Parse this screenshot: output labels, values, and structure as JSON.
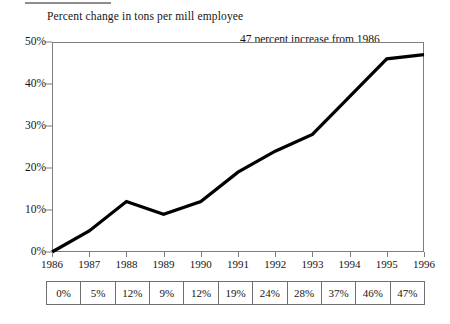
{
  "chart_data": {
    "type": "line",
    "title": "Percent change in tons per mill employee",
    "xlabel": "",
    "ylabel": "",
    "categories": [
      "1986",
      "1987",
      "1988",
      "1989",
      "1990",
      "1991",
      "1992",
      "1993",
      "1994",
      "1995",
      "1996"
    ],
    "values": [
      0,
      5,
      12,
      9,
      12,
      19,
      24,
      28,
      37,
      46,
      47
    ],
    "value_labels": [
      "0%",
      "5%",
      "12%",
      "9%",
      "12%",
      "19%",
      "24%",
      "28%",
      "37%",
      "46%",
      "47%"
    ],
    "ylim": [
      0,
      50
    ],
    "y_ticks": [
      0,
      10,
      20,
      30,
      40,
      50
    ],
    "y_tick_labels": [
      "0%",
      "10%",
      "20%",
      "30%",
      "40%",
      "50%"
    ],
    "grid": false,
    "legend": "none",
    "line_color": "#000000",
    "annotations": [
      {
        "id": "increase",
        "text": "47 percent increase from 1986"
      },
      {
        "id": "cagr_line1",
        "text": "Compounded annual"
      },
      {
        "id": "cagr_line2",
        "text": "growth rate: 3.9 percent"
      }
    ]
  },
  "table": {
    "row_values": [
      "0%",
      "5%",
      "12%",
      "9%",
      "12%",
      "19%",
      "24%",
      "28%",
      "37%",
      "46%",
      "47%"
    ]
  }
}
